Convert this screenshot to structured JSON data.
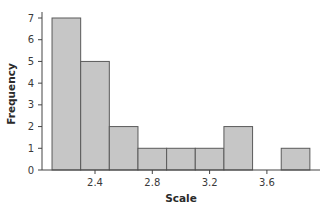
{
  "chart_data": {
    "type": "bar",
    "subtype": "histogram",
    "title": "",
    "xlabel": "Scale",
    "ylabel": "Frequency",
    "bins": [
      {
        "start": 2.1,
        "end": 2.3,
        "count": 7
      },
      {
        "start": 2.3,
        "end": 2.5,
        "count": 5
      },
      {
        "start": 2.5,
        "end": 2.7,
        "count": 2
      },
      {
        "start": 2.7,
        "end": 2.9,
        "count": 1
      },
      {
        "start": 2.9,
        "end": 3.1,
        "count": 1
      },
      {
        "start": 3.1,
        "end": 3.3,
        "count": 1
      },
      {
        "start": 3.3,
        "end": 3.5,
        "count": 2
      },
      {
        "start": 3.5,
        "end": 3.7,
        "count": 0
      },
      {
        "start": 3.7,
        "end": 3.9,
        "count": 1
      }
    ],
    "categories": [
      "2.2",
      "2.4",
      "2.6",
      "2.8",
      "3.0",
      "3.2",
      "3.4",
      "3.6",
      "3.8"
    ],
    "values": [
      7,
      5,
      2,
      1,
      1,
      1,
      2,
      0,
      1
    ],
    "x_ticks": [
      "2.4",
      "2.8",
      "3.2",
      "3.6"
    ],
    "y_ticks": [
      "0",
      "1",
      "2",
      "3",
      "4",
      "5",
      "6",
      "7"
    ],
    "ylim": [
      0,
      7
    ],
    "xlim": [
      2.04,
      3.96
    ],
    "grid": false,
    "legend": null,
    "colors": {
      "bar_fill": "#c6c6c6",
      "bar_edge": "#5a5a5a",
      "axis": "#444444"
    }
  }
}
